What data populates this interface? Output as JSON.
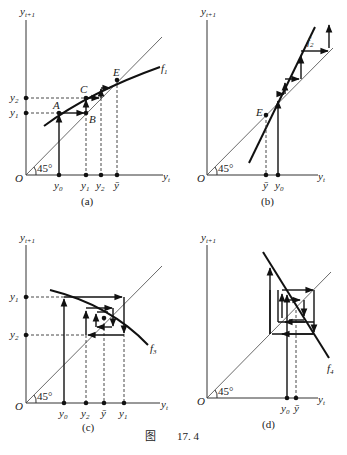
{
  "figure": {
    "caption_prefix": "图",
    "caption_number": "17. 4"
  },
  "axes": {
    "y_label": "y",
    "y_sub": "t+1",
    "x_label": "y",
    "x_sub": "t",
    "origin": "O",
    "angle": "45°"
  },
  "panels": [
    {
      "id": "a",
      "caption": "(a)",
      "curve": "f",
      "curve_sub": "1",
      "points": [
        "A",
        "B",
        "C",
        "E"
      ],
      "x_ticks": [
        {
          "l": "y",
          "s": "0"
        },
        {
          "l": "y",
          "s": "1"
        },
        {
          "l": "y",
          "s": "2"
        },
        {
          "l": "ȳ",
          "s": ""
        }
      ],
      "y_ticks": [
        {
          "l": "y",
          "s": "2"
        },
        {
          "l": "y",
          "s": "1"
        }
      ],
      "behavior": "monotonic convergence"
    },
    {
      "id": "b",
      "caption": "(b)",
      "curve": "f",
      "curve_sub": "2",
      "points": [
        "E"
      ],
      "x_ticks": [
        {
          "l": "ȳ",
          "s": ""
        },
        {
          "l": "y",
          "s": "0"
        }
      ],
      "behavior": "monotonic divergence"
    },
    {
      "id": "c",
      "caption": "(c)",
      "curve": "f",
      "curve_sub": "3",
      "x_ticks": [
        {
          "l": "y",
          "s": "0"
        },
        {
          "l": "y",
          "s": "2"
        },
        {
          "l": "ȳ",
          "s": ""
        },
        {
          "l": "y",
          "s": "1"
        }
      ],
      "y_ticks": [
        {
          "l": "y",
          "s": "1"
        },
        {
          "l": "y",
          "s": "2"
        }
      ],
      "behavior": "damped oscillation (convergent cobweb)"
    },
    {
      "id": "d",
      "caption": "(d)",
      "curve": "f",
      "curve_sub": "4",
      "x_ticks": [
        {
          "l": "y",
          "s": "0"
        },
        {
          "l": "ȳ",
          "s": ""
        }
      ],
      "behavior": "explosive oscillation (divergent cobweb)"
    }
  ]
}
